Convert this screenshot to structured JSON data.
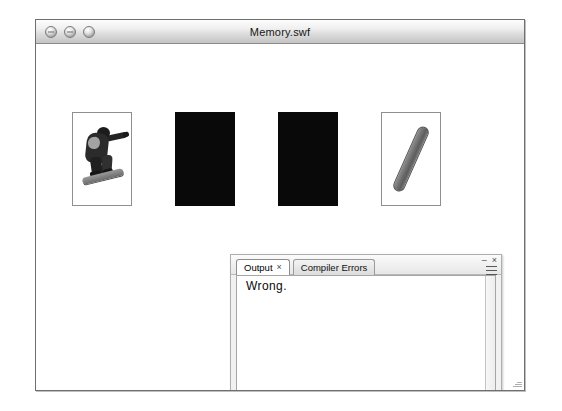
{
  "window": {
    "title": "Memory.swf",
    "traffic_lights": [
      {
        "name": "close",
        "glyph": "close-icon"
      },
      {
        "name": "minimize",
        "glyph": "minimize-icon"
      },
      {
        "name": "zoom",
        "glyph": "zoom-icon"
      }
    ],
    "resize_grip_label": "resize-grip"
  },
  "game": {
    "cards": [
      {
        "id": "card-1",
        "state": "face-up",
        "image": "snowboarder-jumping"
      },
      {
        "id": "card-2",
        "state": "face-down",
        "image": "card-back-black"
      },
      {
        "id": "card-3",
        "state": "face-down",
        "image": "card-back-black"
      },
      {
        "id": "card-4",
        "state": "face-up",
        "image": "snowboard-diagonal"
      }
    ],
    "card_count": 4,
    "face_up_count": 2,
    "face_down_count": 2
  },
  "output_panel": {
    "tabs": [
      {
        "label": "Output",
        "active": true,
        "closable": true,
        "close_glyph": "×"
      },
      {
        "label": "Compiler Errors",
        "active": false,
        "closable": false,
        "close_glyph": ""
      }
    ],
    "console_text": "Wrong.",
    "controls": {
      "minimize_glyph": "–",
      "close_glyph": "×",
      "menu_label": "panel-menu"
    },
    "scrollbars": {
      "vertical": "vertical-scrollbar",
      "horizontal": "horizontal-scrollbar"
    }
  },
  "colors": {
    "window_border": "#6f6f6f",
    "titlebar_top": "#fdfdfd",
    "titlebar_bottom": "#c4c4c4",
    "card_back": "#090909",
    "card_border": "#8f8f8f",
    "panel_bg": "#f1f1f1",
    "console_bg": "#ffffff",
    "text": "#0a0a0a"
  }
}
